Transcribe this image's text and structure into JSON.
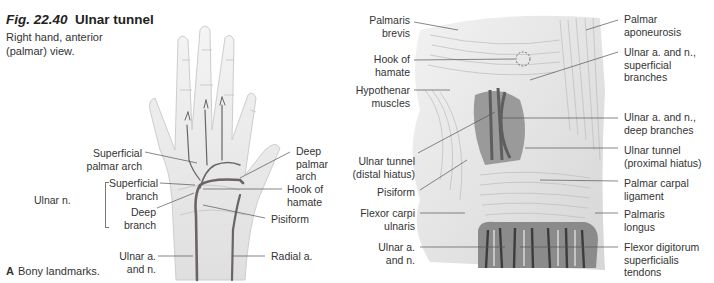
{
  "figure": {
    "number": "Fig. 22.40",
    "title": "Ulnar tunnel",
    "subtitle": "Right hand, anterior (palmar) view."
  },
  "panel_a": {
    "caption_letter": "A",
    "caption_text": "Bony landmarks.",
    "labels": {
      "superficial_palmar_arch": "Superficial palmar arch",
      "ulnar_n": "Ulnar n.",
      "superficial_branch": "Superficial branch",
      "deep_branch": "Deep branch",
      "ulnar_a_and_n": "Ulnar a. and n.",
      "deep_palmar_arch": "Deep palmar arch",
      "hook_of_hamate": "Hook of hamate",
      "pisiform": "Pisiform",
      "radial_a": "Radial a."
    }
  },
  "panel_b": {
    "labels": {
      "palmaris_brevis": "Palmaris brevis",
      "hook_of_hamate": "Hook of hamate",
      "hypothenar_muscles": "Hypothenar muscles",
      "ulnar_tunnel_distal": "Ulnar tunnel (distal hiatus)",
      "pisiform": "Pisiform",
      "flexor_carpi_ulnaris": "Flexor carpi ulnaris",
      "ulnar_a_and_n": "Ulnar a. and n.",
      "palmar_aponeurosis": "Palmar aponeurosis",
      "ulnar_superficial_branches": "Ulnar a. and n., superficial branches",
      "ulnar_deep_branches": "Ulnar a. and n., deep branches",
      "ulnar_tunnel_proximal": "Ulnar tunnel (proximal hiatus)",
      "palmar_carpal_ligament": "Palmar carpal ligament",
      "palmaris_longus": "Palmaris longus",
      "flexor_digitorum_superficialis": "Flexor digitorum superficialis tendons"
    }
  },
  "colors": {
    "vessel": "#6b6464",
    "bone": "#d9d9d9",
    "tissue": "#e6e6e6",
    "leader": "#555555"
  }
}
